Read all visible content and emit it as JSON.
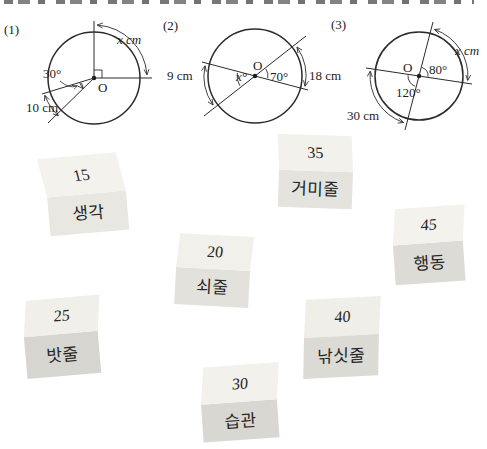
{
  "page": {
    "ink_color": "#2b2b2b",
    "block_top_face_color": "#f2f1ec",
    "block_front_face_color": "#e0ded8"
  },
  "problems": [
    {
      "id": "(1)",
      "center_label": "O",
      "arc_unknown": "x cm",
      "angle_known": "30°",
      "arc_known": "10 cm"
    },
    {
      "id": "(2)",
      "center_label": "O",
      "arc_left": "9 cm",
      "angle_unknown": "x°",
      "angle_known": "70°",
      "arc_right": "18 cm"
    },
    {
      "id": "(3)",
      "center_label": "O",
      "angle_known_right": "80°",
      "angle_known_left": "120°",
      "arc_unknown": "x cm",
      "arc_known": "30 cm"
    }
  ],
  "blocks": [
    {
      "number": "15",
      "word": "생각"
    },
    {
      "number": "35",
      "word": "거미줄"
    },
    {
      "number": "20",
      "word": "쇠줄"
    },
    {
      "number": "45",
      "word": "행동"
    },
    {
      "number": "25",
      "word": "밧줄"
    },
    {
      "number": "40",
      "word": "낚싯줄"
    },
    {
      "number": "30",
      "word": "습관"
    }
  ]
}
